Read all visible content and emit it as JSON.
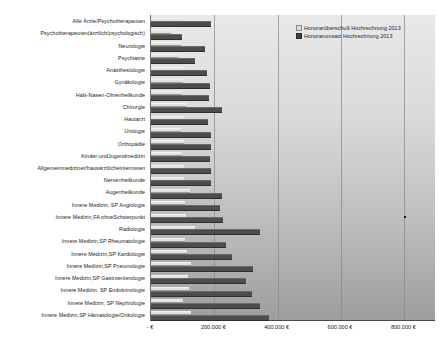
{
  "legend": {
    "position": "top-right",
    "items": [
      {
        "label": "Honorarüberschuß Hochrechnung 2013",
        "color": "#dcdcdc",
        "key": "ueberschuss"
      },
      {
        "label": "Honorarumsatz Hochrechnung 2013",
        "color": "#3f3f3f",
        "key": "umsatz"
      }
    ]
  },
  "axis": {
    "tick_labels": [
      "- €",
      "200.000 €",
      "400.000 €",
      "600.000 €",
      "800.000 €"
    ],
    "tick_values": [
      0,
      200000,
      400000,
      600000,
      800000
    ]
  },
  "chart_data": {
    "type": "bar",
    "orientation": "horizontal",
    "title": "",
    "xlabel": "",
    "ylabel": "",
    "xlim": [
      0,
      900000
    ],
    "grid": true,
    "currency": "€",
    "categories": [
      "Alle Ärzte/Psychotherapeuten",
      "Psychotherapeuten(ärztlich/psychologisch)",
      "Neurologie",
      "Psychiatrie",
      "Anästhesiologie",
      "Gynäkologie",
      "Hals-Nasen-Ohrenheilkunde",
      "Chirurgie",
      "Hautarzt",
      "Urologie",
      "Orthopädie",
      "Kinder-undJugendmedizin",
      "Allgemeinmediziner/hausärztlicheInternisten",
      "Nervenheilkunde",
      "Augenheilkunde",
      "Innere Medizin, SP Angiologie",
      "Innere Medizin,FA ohneSchwerpunkt",
      "Radiologie",
      "Innere Medizin,SP Rheumatologie",
      "Innere Medizin,SP Kardiologie",
      "Innere Medizin,SP Pneumologie",
      "Innere Medizin,SP Gastroenterologie",
      "Innere Medizin, SP Endokrinologie",
      "Innere Medizin, SP Nephrologie",
      "Innere Medizin,SP Hämatologie/Onkologie"
    ],
    "series": [
      {
        "name": "Honorarüberschuß Hochrechnung 2013",
        "key": "ueberschuss",
        "color": "#dcdcdc",
        "values": [
          97000,
          64000,
          95000,
          85000,
          105000,
          100000,
          99000,
          112000,
          104000,
          96000,
          103000,
          99000,
          103000,
          105000,
          123000,
          106000,
          112000,
          140000,
          108000,
          113000,
          127000,
          118000,
          120000,
          100000,
          125000
        ]
      },
      {
        "name": "Honorarumsatz Hochrechnung 2013",
        "key": "umsatz",
        "color": "#3f3f3f",
        "values": [
          190000,
          98000,
          170000,
          140000,
          178000,
          187000,
          182000,
          225000,
          180000,
          188000,
          191000,
          185000,
          190000,
          190000,
          225000,
          219000,
          228000,
          344000,
          237000,
          255000,
          322000,
          300000,
          318000,
          345000,
          372000
        ]
      }
    ],
    "annotations": [
      {
        "type": "point-marker",
        "category": "Innere Medizin,FA ohneSchwerpunkt",
        "x_value": 800000
      }
    ]
  }
}
